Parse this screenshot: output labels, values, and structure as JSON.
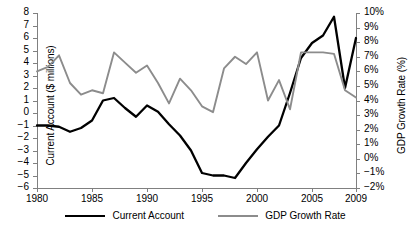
{
  "chart_data": {
    "type": "line",
    "title": "",
    "xlabel": "",
    "ylabel": "Current Account ($ millions)",
    "y2label": "GDP Growth Rate (%)",
    "grid": false,
    "legend_position": "bottom",
    "x": [
      1980,
      1981,
      1982,
      1983,
      1984,
      1985,
      1986,
      1987,
      1988,
      1989,
      1990,
      1991,
      1992,
      1993,
      1994,
      1995,
      1996,
      1997,
      1998,
      1999,
      2000,
      2001,
      2002,
      2003,
      2004,
      2005,
      2006,
      2007,
      2008,
      2009
    ],
    "xlim": [
      1980,
      2009
    ],
    "ylim": [
      -6,
      8
    ],
    "y2lim": [
      -2,
      10
    ],
    "ytick_labels": [
      "8",
      "7",
      "6",
      "5",
      "4",
      "3",
      "2",
      "1",
      "0",
      "-1",
      "-2",
      "-3",
      "-4",
      "-5",
      "-6"
    ],
    "ytick_values": [
      8,
      7,
      6,
      5,
      4,
      3,
      2,
      1,
      0,
      -1,
      -2,
      -3,
      -4,
      -5,
      -6
    ],
    "y2tick_labels": [
      "10%",
      "9%",
      "8%",
      "7%",
      "6%",
      "5%",
      "4%",
      "3%",
      "2%",
      "1%",
      "0%",
      "-1%",
      "-2%"
    ],
    "y2tick_values": [
      10,
      9,
      8,
      7,
      6,
      5,
      4,
      3,
      2,
      1,
      0,
      -1,
      -2
    ],
    "xtick_labels": [
      "1980",
      "1985",
      "1990",
      "1995",
      "2000",
      "2005",
      "2009"
    ],
    "xtick_values": [
      1980,
      1985,
      1990,
      1995,
      2000,
      2005,
      2009
    ],
    "series": [
      {
        "name": "Current Account",
        "axis": "left",
        "color": "#000000",
        "values": [
          -1.0,
          -1.0,
          -1.1,
          -1.5,
          -1.2,
          -0.6,
          1.0,
          1.2,
          0.4,
          -0.3,
          0.6,
          0.1,
          -0.9,
          -1.8,
          -3.0,
          -4.8,
          -5.0,
          -5.0,
          -5.2,
          -4.0,
          -2.9,
          -1.9,
          -1.0,
          1.6,
          4.4,
          5.6,
          6.2,
          7.7,
          2.0,
          6.0
        ]
      },
      {
        "name": "GDP Growth Rate",
        "axis": "right",
        "color": "#8c8c8c",
        "values": [
          6.0,
          6.3,
          7.1,
          5.2,
          4.4,
          4.7,
          4.5,
          7.3,
          6.6,
          5.9,
          6.4,
          5.2,
          3.8,
          5.5,
          4.7,
          3.6,
          3.2,
          6.2,
          7.0,
          6.5,
          7.3,
          4.0,
          5.4,
          3.4,
          7.3,
          7.3,
          7.3,
          7.2,
          4.7,
          4.2
        ]
      }
    ]
  },
  "legend": {
    "items": [
      {
        "label": "Current Account",
        "color": "#000000"
      },
      {
        "label": "GDP Growth Rate",
        "color": "#8c8c8c"
      }
    ]
  }
}
